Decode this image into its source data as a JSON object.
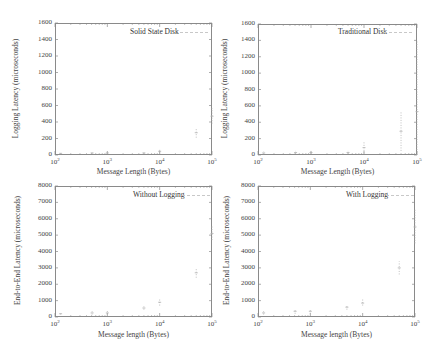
{
  "chart_data": [
    {
      "type": "scatter",
      "title": "",
      "legend": "Solid State Disk",
      "xlabel": "Message Length (Bytes)",
      "ylabel": "Logging Latency (microseconds)",
      "xscale": "log",
      "xlim": [
        100,
        100000
      ],
      "ylim": [
        0,
        1600
      ],
      "yticks": [
        "0",
        "200",
        "400",
        "600",
        "800",
        "1000",
        "1200",
        "1400",
        "1600"
      ],
      "xticks": [
        "10^2",
        "10^3",
        "10^4",
        "10^5"
      ],
      "series": [
        {
          "name": "Solid State Disk",
          "x": [
            128,
            512,
            1000,
            5000,
            10000,
            50000,
            100000
          ],
          "values": [
            20,
            25,
            25,
            25,
            45,
            270,
            470
          ],
          "min": [
            10,
            15,
            15,
            15,
            20,
            210,
            380
          ],
          "max": [
            35,
            40,
            40,
            45,
            70,
            320,
            570
          ]
        }
      ]
    },
    {
      "type": "scatter",
      "title": "",
      "legend": "Traditional Disk",
      "xlabel": "Message Length (Bytes)",
      "ylabel": "Logging Latency (microseconds)",
      "xscale": "log",
      "xlim": [
        100,
        100000
      ],
      "ylim": [
        0,
        1600
      ],
      "yticks": [
        "0",
        "200",
        "400",
        "600",
        "800",
        "1000",
        "1200",
        "1400",
        "1600"
      ],
      "xticks": [
        "10^2",
        "10^3",
        "10^4",
        "10^5"
      ],
      "series": [
        {
          "name": "Traditional Disk",
          "x": [
            128,
            512,
            1000,
            5000,
            10000,
            50000,
            100000
          ],
          "values": [
            25,
            30,
            30,
            30,
            90,
            290,
            530
          ],
          "min": [
            10,
            15,
            15,
            15,
            20,
            50,
            0
          ],
          "max": [
            45,
            50,
            50,
            50,
            170,
            530,
            1400
          ]
        }
      ]
    },
    {
      "type": "scatter",
      "title": "",
      "legend": "Without Logging",
      "xlabel": "Message length (Bytes)",
      "ylabel": "End-to-End Latency (microseconds)",
      "xscale": "log",
      "xlim": [
        100,
        100000
      ],
      "ylim": [
        0,
        8000
      ],
      "yticks": [
        "0",
        "1000",
        "2000",
        "3000",
        "4000",
        "5000",
        "6000",
        "7000",
        "8000"
      ],
      "xticks": [
        "10^2",
        "10^3",
        "10^4",
        "10^5"
      ],
      "series": [
        {
          "name": "Without Logging",
          "x": [
            128,
            512,
            1000,
            5000,
            10000,
            50000,
            100000
          ],
          "values": [
            200,
            250,
            250,
            550,
            900,
            2700,
            5100
          ],
          "min": [
            150,
            150,
            150,
            450,
            700,
            2400,
            4700
          ],
          "max": [
            300,
            350,
            400,
            650,
            1100,
            3000,
            5600
          ]
        }
      ]
    },
    {
      "type": "scatter",
      "title": "",
      "legend": "With Logging",
      "xlabel": "Message length (Bytes)",
      "ylabel": "End-to-End Latency (microseconds)",
      "xscale": "log",
      "xlim": [
        100,
        100000
      ],
      "ylim": [
        0,
        8000
      ],
      "yticks": [
        "0",
        "1000",
        "2000",
        "3000",
        "4000",
        "5000",
        "6000",
        "7000",
        "8000"
      ],
      "xticks": [
        "10^2",
        "10^3",
        "10^4",
        "10^5"
      ],
      "series": [
        {
          "name": "With Logging",
          "x": [
            128,
            512,
            1000,
            5000,
            10000,
            50000,
            100000
          ],
          "values": [
            250,
            350,
            350,
            600,
            850,
            3000,
            5500
          ],
          "min": [
            150,
            200,
            200,
            450,
            700,
            2600,
            4500
          ],
          "max": [
            350,
            500,
            500,
            750,
            1100,
            3400,
            6600
          ]
        }
      ]
    }
  ],
  "panels": [
    {
      "legend": "Solid State Disk",
      "xlabel": "Message Length (Bytes)",
      "ylabel": "Logging Latency (microseconds)"
    },
    {
      "legend": "Traditional Disk",
      "xlabel": "Message Length (Bytes)",
      "ylabel": "Logging Latency (microseconds)"
    },
    {
      "legend": "Without Logging",
      "xlabel": "Message length (Bytes)",
      "ylabel": "End-to-End Latency (microseconds)"
    },
    {
      "legend": "With Logging",
      "xlabel": "Message length (Bytes)",
      "ylabel": "End-to-End Latency (microseconds)"
    }
  ],
  "colors": {
    "frame": "#8a8a8a",
    "points": "#b0b0b0",
    "text": "#444444"
  }
}
